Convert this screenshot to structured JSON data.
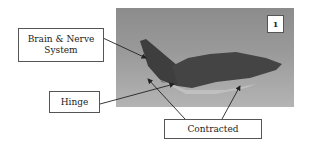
{
  "figure": {
    "panel_number": "1",
    "labels": {
      "brain": "Brain & Nerve System",
      "hinge": "Hinge",
      "contracted": "Contracted"
    },
    "photo_subject": "insect-specimen-photo"
  }
}
